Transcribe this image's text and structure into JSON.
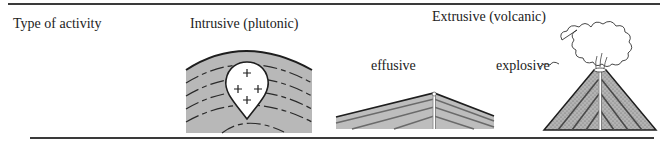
{
  "header": {
    "type_label": "Type of activity",
    "intrusive_label": "Intrusive (plutonic)",
    "extrusive_label": "Extrusive (volcanic)"
  },
  "extrusive": {
    "effusive_label": "effusive",
    "explosive_label": "explosive"
  },
  "figures": [
    {
      "name": "plutonic-intrusion",
      "description": "teardrop-shaped igneous body with plus signs within arched gray strata"
    },
    {
      "name": "shield-volcano",
      "description": "low, broad layered cone with central vent"
    },
    {
      "name": "stratovolcano",
      "description": "steep stippled layered cone with erupting ash cloud"
    }
  ],
  "colors": {
    "strata_fill": "#b8b8b8",
    "line": "#2a2a2a",
    "background": "#ffffff"
  }
}
